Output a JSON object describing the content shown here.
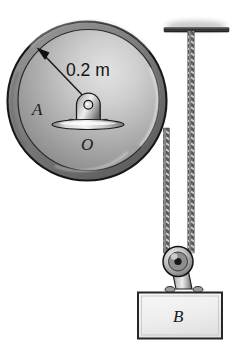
{
  "figure": {
    "background_color": "#ffffff",
    "labels": {
      "disk_label": "A",
      "center_label": "O",
      "radius_dimension": "0.2 m",
      "block_label": "B"
    },
    "colors": {
      "outline": "#1a1a1a",
      "disk_rim_dark": "#6e6e6e",
      "disk_face_light": "#d8d8d8",
      "disk_face_mid": "#a8a8a8",
      "disk_face_dark": "#7a7a7a",
      "metal_light": "#e6e6e6",
      "metal_mid": "#9a9a9a",
      "metal_dark": "#4a4a4a",
      "cord_light": "#d5d5d5",
      "cord_dark": "#4f4f4f",
      "block_fill": "#efefef",
      "block_border": "#2b2b2b",
      "ceiling_bar": "#3a3a3a"
    },
    "geometry": {
      "disk": {
        "cx": 87,
        "cy": 101,
        "r_outer": 80,
        "r_inner": 71
      },
      "hub": {
        "cx": 88,
        "cy": 105,
        "pin_r": 4
      },
      "base_plate": {
        "cx": 88,
        "cy": 124,
        "rx": 36,
        "ry": 5
      },
      "ceiling_bar": {
        "x1": 164,
        "x2": 229,
        "y": 30
      },
      "pulley": {
        "cx": 178,
        "cy": 262,
        "r": 15
      },
      "block": {
        "x": 138,
        "y": 293,
        "w": 84,
        "h": 46
      },
      "cord_left": {
        "x": 166,
        "y_top": 131,
        "y_bottom": 250
      },
      "cord_right": {
        "x": 191,
        "y_top": 31,
        "y_bottom": 250
      }
    },
    "elements": {
      "disk_name": "disk-a",
      "center_name": "center-o",
      "radius_arrow_name": "radius-dimension-arrow",
      "block_name": "block-b",
      "pulley_name": "pulley",
      "ceiling_name": "ceiling-support",
      "cord_left_name": "cord-from-disk",
      "cord_right_name": "cord-from-ceiling"
    }
  }
}
